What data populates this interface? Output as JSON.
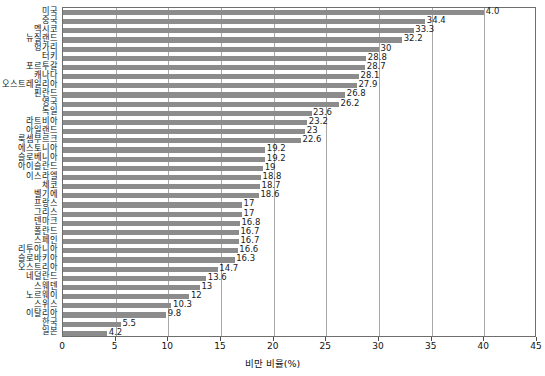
{
  "chart_data": {
    "type": "bar",
    "orientation": "horizontal",
    "title": "",
    "xlabel": "비만 비율(%)",
    "ylabel": "",
    "xlim": [
      0,
      45
    ],
    "xticks": [
      0,
      5,
      10,
      15,
      20,
      25,
      30,
      35,
      40,
      45
    ],
    "xtick_labels": [
      "0",
      "5",
      "10",
      "15",
      "20",
      "25",
      "30",
      "35",
      "40",
      "45"
    ],
    "grid": true,
    "grid_axis": "x",
    "legend": false,
    "bar_color": "#8c8c8c",
    "categories": [
      "미국",
      "중국",
      "멕시코",
      "뉴질랜드",
      "헝가리",
      "터키",
      "포르투갈",
      "캐나다",
      "오스트레일리아",
      "핀란드",
      "영국",
      "독일",
      "라트비아",
      "아일랜드",
      "룩셈부르크",
      "에스토니아",
      "슬로베니아",
      "아이슬란드",
      "이스라엘",
      "체코",
      "벨기에",
      "프랑스",
      "그리스",
      "덴마크",
      "폴란드",
      "스페인",
      "리투아니아",
      "슬로바키아",
      "오스트리아",
      "네덜란드",
      "스웨덴",
      "노르웨이",
      "스위스",
      "이탈리아",
      "한국",
      "일본"
    ],
    "values": [
      40.0,
      34.4,
      33.3,
      32.2,
      30,
      28.8,
      28.7,
      28.1,
      27.9,
      26.8,
      26.2,
      23.6,
      23.2,
      23,
      22.6,
      19.2,
      19.2,
      19,
      18.8,
      18.7,
      18.6,
      17,
      17,
      16.8,
      16.7,
      16.7,
      16.6,
      16.3,
      14.7,
      13.6,
      13,
      12,
      10.3,
      9.8,
      5.5,
      4.2
    ],
    "value_labels": [
      "4.0",
      "34.4",
      "33.3",
      "32.2",
      "30",
      "28.8",
      "28.7",
      "28.1",
      "27.9",
      "26.8",
      "26.2",
      "23.6",
      "23.2",
      "23",
      "22.6",
      "19.2",
      "19.2",
      "19",
      "18.8",
      "18.7",
      "18.6",
      "17",
      "17",
      "16.8",
      "16.7",
      "16.7",
      "16.6",
      "16.3",
      "14.7",
      "13.6",
      "13",
      "12",
      "10.3",
      "9.8",
      "5.5",
      "4.2"
    ]
  }
}
